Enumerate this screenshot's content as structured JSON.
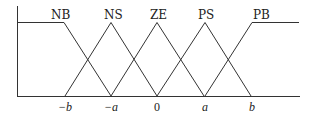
{
  "diagram": {
    "type": "fuzzy membership functions",
    "sets": [
      {
        "label": "NB",
        "shape": "left-shoulder",
        "points": [
          [
            "-inf",
            1
          ],
          [
            "-b",
            1
          ],
          [
            "-a",
            0
          ]
        ]
      },
      {
        "label": "NS",
        "shape": "triangle",
        "points": [
          [
            "-b",
            0
          ],
          [
            "-a",
            1
          ],
          [
            "0",
            0
          ]
        ]
      },
      {
        "label": "ZE",
        "shape": "triangle",
        "points": [
          [
            "-a",
            0
          ],
          [
            "0",
            1
          ],
          [
            "a",
            0
          ]
        ]
      },
      {
        "label": "PS",
        "shape": "triangle",
        "points": [
          [
            "0",
            0
          ],
          [
            "a",
            1
          ],
          [
            "b",
            0
          ]
        ]
      },
      {
        "label": "PB",
        "shape": "right-shoulder",
        "points": [
          [
            "a",
            0
          ],
          [
            "b",
            1
          ],
          [
            "inf",
            1
          ]
        ]
      }
    ],
    "x_ticks": [
      "−b",
      "−a",
      "0",
      "a",
      "b"
    ],
    "line_color": "#333333"
  }
}
